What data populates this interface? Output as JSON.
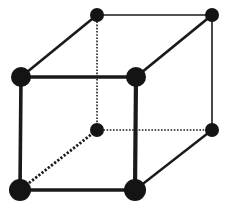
{
  "diagram": {
    "title": "",
    "type": "cube-lattice",
    "colors": {
      "background": "#ffffff",
      "stroke": "#1a1a1a",
      "node": "#141414"
    },
    "nodes": [
      {
        "id": "back-top-left",
        "x": 97,
        "y": 15,
        "r": 7
      },
      {
        "id": "back-top-right",
        "x": 212,
        "y": 15,
        "r": 7
      },
      {
        "id": "front-top-left",
        "x": 21,
        "y": 77,
        "r": 10
      },
      {
        "id": "front-top-right",
        "x": 136,
        "y": 77,
        "r": 10
      },
      {
        "id": "back-bottom-left",
        "x": 97,
        "y": 130,
        "r": 7
      },
      {
        "id": "back-bottom-right",
        "x": 212,
        "y": 130,
        "r": 7
      },
      {
        "id": "front-bottom-left",
        "x": 20,
        "y": 190,
        "r": 11
      },
      {
        "id": "front-bottom-right",
        "x": 135,
        "y": 190,
        "r": 11
      }
    ],
    "edges": [
      {
        "from": "back-top-left",
        "to": "back-top-right",
        "style": "solid",
        "width": 1.6
      },
      {
        "from": "back-top-right",
        "to": "back-bottom-right",
        "style": "solid",
        "width": 1.6
      },
      {
        "from": "back-top-left",
        "to": "front-top-left",
        "style": "solid",
        "width": 2.6
      },
      {
        "from": "back-top-right",
        "to": "front-top-right",
        "style": "solid",
        "width": 2.8
      },
      {
        "from": "back-bottom-right",
        "to": "front-bottom-right",
        "style": "solid",
        "width": 2.4
      },
      {
        "from": "front-top-left",
        "to": "front-top-right",
        "style": "solid",
        "width": 3.6
      },
      {
        "from": "front-top-left",
        "to": "front-bottom-left",
        "style": "solid",
        "width": 3.6
      },
      {
        "from": "front-top-right",
        "to": "front-bottom-right",
        "style": "solid",
        "width": 4.2
      },
      {
        "from": "front-bottom-left",
        "to": "front-bottom-right",
        "style": "solid",
        "width": 3.6
      },
      {
        "from": "back-top-left",
        "to": "back-bottom-left",
        "style": "dotted",
        "width": 1.6
      },
      {
        "from": "back-bottom-left",
        "to": "back-bottom-right",
        "style": "dotted",
        "width": 1.6
      },
      {
        "from": "back-bottom-left",
        "to": "front-bottom-left",
        "style": "dotted",
        "width": 2.8
      }
    ]
  }
}
